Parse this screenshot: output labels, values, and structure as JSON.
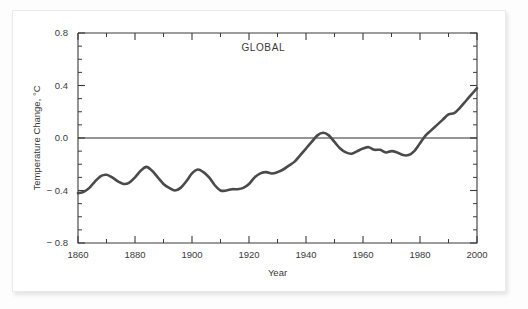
{
  "figure": {
    "background_color": "#ffffff",
    "card_border_color": "#e9e9e9",
    "line_color": "#4a4a4a",
    "axis_color": "#3b3b3b"
  },
  "chart_data": {
    "type": "line",
    "title": "GLOBAL",
    "xlabel": "Year",
    "ylabel": "Temperature Change, °C",
    "xlim": [
      1860,
      2000
    ],
    "ylim": [
      -0.8,
      0.8
    ],
    "xticks": [
      1860,
      1880,
      1900,
      1920,
      1940,
      1960,
      1980,
      2000
    ],
    "xtick_labels": [
      "1860",
      "1880",
      "1900",
      "1920",
      "1940",
      "1960",
      "1980",
      "2000"
    ],
    "xminor_step": 10,
    "yticks": [
      -0.8,
      -0.4,
      0.0,
      0.4,
      0.8
    ],
    "ytick_labels": [
      "-0.8",
      "-0.4",
      "0.0",
      "0.4",
      "0.8"
    ],
    "yminor_step": 0.1,
    "grid": false,
    "legend": null,
    "zero_reference_line": 0.0,
    "annotations": [
      {
        "text": "GLOBAL",
        "x": 1925,
        "y": 0.66
      }
    ],
    "series": [
      {
        "name": "Global temperature change",
        "x": [
          1860,
          1862,
          1864,
          1866,
          1868,
          1870,
          1872,
          1874,
          1876,
          1878,
          1880,
          1882,
          1884,
          1886,
          1888,
          1890,
          1892,
          1894,
          1896,
          1898,
          1900,
          1902,
          1904,
          1906,
          1908,
          1910,
          1912,
          1914,
          1916,
          1918,
          1920,
          1922,
          1924,
          1926,
          1928,
          1930,
          1932,
          1934,
          1936,
          1938,
          1940,
          1942,
          1944,
          1946,
          1948,
          1950,
          1952,
          1954,
          1956,
          1958,
          1960,
          1962,
          1964,
          1966,
          1968,
          1970,
          1972,
          1974,
          1976,
          1978,
          1980,
          1982,
          1984,
          1986,
          1988,
          1990,
          1992,
          1994,
          1996,
          1998,
          2000
        ],
        "y": [
          -0.42,
          -0.41,
          -0.38,
          -0.33,
          -0.29,
          -0.28,
          -0.3,
          -0.33,
          -0.35,
          -0.34,
          -0.3,
          -0.25,
          -0.22,
          -0.25,
          -0.3,
          -0.35,
          -0.38,
          -0.4,
          -0.38,
          -0.33,
          -0.27,
          -0.24,
          -0.26,
          -0.3,
          -0.36,
          -0.4,
          -0.4,
          -0.39,
          -0.39,
          -0.38,
          -0.35,
          -0.3,
          -0.27,
          -0.26,
          -0.27,
          -0.26,
          -0.24,
          -0.21,
          -0.18,
          -0.13,
          -0.08,
          -0.03,
          0.02,
          0.04,
          0.02,
          -0.03,
          -0.08,
          -0.11,
          -0.12,
          -0.1,
          -0.08,
          -0.07,
          -0.09,
          -0.09,
          -0.11,
          -0.1,
          -0.11,
          -0.13,
          -0.13,
          -0.1,
          -0.04,
          0.02,
          0.06,
          0.1,
          0.14,
          0.18,
          0.19,
          0.23,
          0.28,
          0.33,
          0.38
        ]
      }
    ]
  }
}
